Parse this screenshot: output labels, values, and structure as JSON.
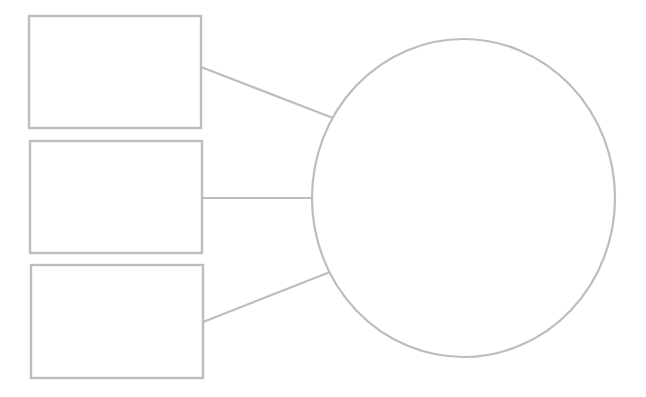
{
  "diagram": {
    "type": "graphic-organizer-template",
    "stroke_color": "#bdbdbd",
    "fill_color": "#ffffff",
    "background": "#ffffff",
    "boxes": [
      {
        "id": "box-1",
        "x": 29,
        "y": 16,
        "width": 172,
        "height": 112,
        "label": ""
      },
      {
        "id": "box-2",
        "x": 30,
        "y": 141,
        "width": 172,
        "height": 112,
        "label": ""
      },
      {
        "id": "box-3",
        "x": 31,
        "y": 265,
        "width": 172,
        "height": 113,
        "label": ""
      }
    ],
    "circle": {
      "id": "main-circle",
      "cx": 463.5,
      "cy": 198,
      "rx": 151.5,
      "ry": 159,
      "label": ""
    },
    "connectors": [
      {
        "id": "connector-1",
        "x1": 201,
        "y1": 67,
        "x2": 333,
        "y2": 118
      },
      {
        "id": "connector-2",
        "x1": 202,
        "y1": 198,
        "x2": 312,
        "y2": 198
      },
      {
        "id": "connector-3",
        "x1": 203,
        "y1": 322,
        "x2": 330,
        "y2": 272
      }
    ]
  }
}
